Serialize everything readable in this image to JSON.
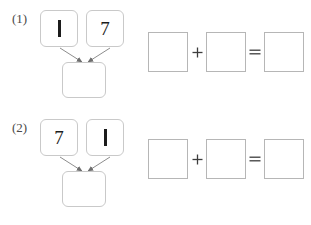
{
  "worksheet": {
    "background_color": "#ffffff",
    "box_border_color": "#c9c9c9",
    "equation_border_color": "#b6b6b6",
    "digit_color": "#1c1c1c",
    "label_color": "#4a4a4a"
  },
  "problems": [
    {
      "label": "(1)",
      "bond": {
        "left_addend": "1",
        "right_addend": "7",
        "sum": "",
        "left_arrow_name": "arrow-left-to-sum",
        "right_arrow_name": "arrow-right-to-sum"
      },
      "equation": {
        "operand_1": "",
        "plus": "+",
        "operand_2": "",
        "equals": "=",
        "result": ""
      }
    },
    {
      "label": "(2)",
      "bond": {
        "left_addend": "7",
        "right_addend": "1",
        "sum": "",
        "left_arrow_name": "arrow-left-to-sum",
        "right_arrow_name": "arrow-right-to-sum"
      },
      "equation": {
        "operand_1": "",
        "plus": "+",
        "operand_2": "",
        "equals": "=",
        "result": ""
      }
    }
  ]
}
